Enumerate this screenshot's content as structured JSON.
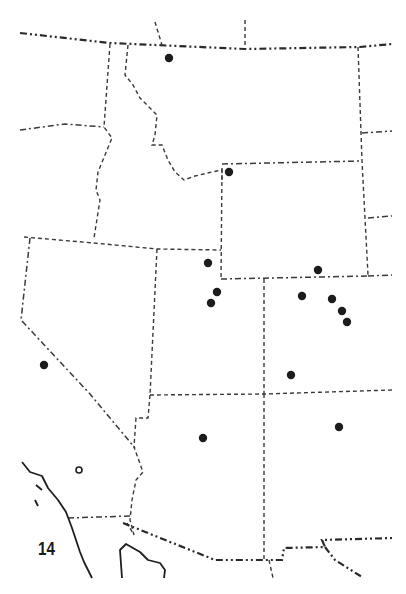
{
  "figure": {
    "number_label": "14",
    "type": "distribution map",
    "region": "Western United States"
  },
  "legend_symbols": {
    "filled_circle": "record",
    "hollow_circle": "record (open symbol)"
  },
  "colors": {
    "background": "#ffffff",
    "lines": "#2a2a2a",
    "points": "#1c1c1c"
  },
  "points": {
    "filled": [
      {
        "x": 169,
        "y": 58
      },
      {
        "x": 229,
        "y": 172
      },
      {
        "x": 208,
        "y": 263
      },
      {
        "x": 318,
        "y": 270
      },
      {
        "x": 217,
        "y": 292
      },
      {
        "x": 211,
        "y": 303
      },
      {
        "x": 302,
        "y": 296
      },
      {
        "x": 332,
        "y": 299
      },
      {
        "x": 342,
        "y": 311
      },
      {
        "x": 347,
        "y": 322
      },
      {
        "x": 44,
        "y": 365
      },
      {
        "x": 291,
        "y": 375
      },
      {
        "x": 203,
        "y": 438
      },
      {
        "x": 339,
        "y": 427
      }
    ],
    "hollow": [
      {
        "x": 79,
        "y": 470
      }
    ]
  }
}
